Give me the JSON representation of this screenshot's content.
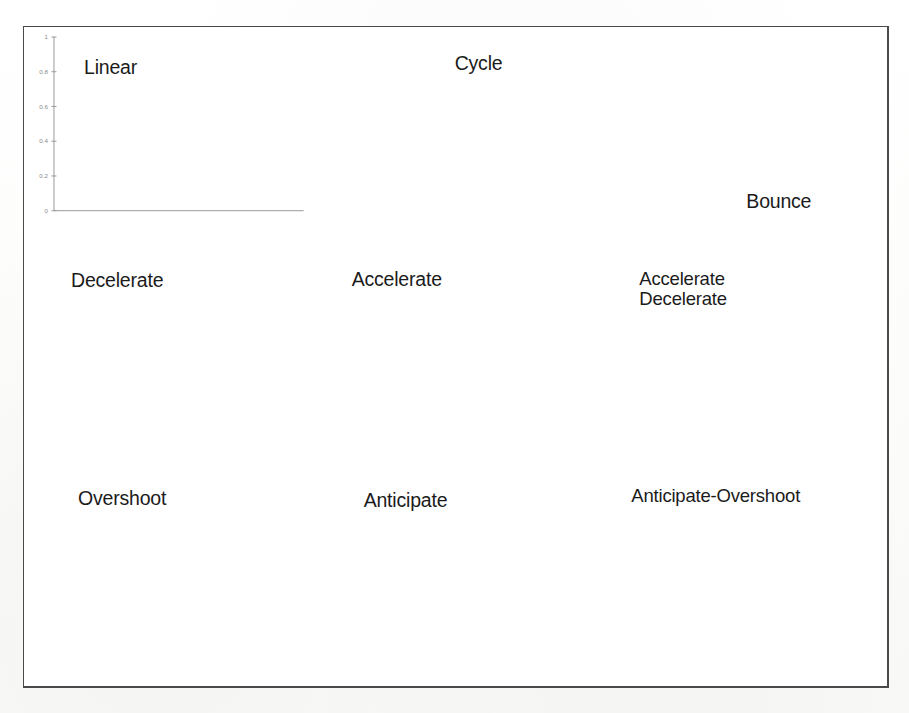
{
  "page": {
    "background_color": "#fdfdfc",
    "frame_color": "#4a4a4a",
    "curve_color": "#5d5d5d",
    "axis_color": "#9a9a9a",
    "label_color": "#8a8a8a",
    "title_color": "#1b1b1b"
  },
  "common": {
    "xlabel": "time",
    "x_ticks": [
      "0",
      "0.2",
      "0.4",
      "0.6",
      "0.8",
      "1"
    ],
    "x_tick_values": [
      0,
      0.2,
      0.4,
      0.6,
      0.8,
      1
    ],
    "xlim": [
      0,
      1
    ]
  },
  "chart_data": [
    {
      "id": "linear",
      "type": "line",
      "title": "Linear",
      "xlabel": "time",
      "ylabel": "",
      "xlim": [
        0,
        1
      ],
      "ylim": [
        0,
        1
      ],
      "grid": false,
      "legend": "none",
      "x_ticks": [
        "0",
        "0.2",
        "0.4",
        "0.6",
        "0.8",
        "1"
      ],
      "y_ticks": [
        "0",
        "0.2",
        "0.4",
        "0.6",
        "0.8",
        "1"
      ],
      "y_tick_values": [
        0,
        0.2,
        0.4,
        0.6,
        0.8,
        1
      ],
      "x": [
        0,
        0.05,
        0.1,
        0.15,
        0.2,
        0.25,
        0.3,
        0.35,
        0.4,
        0.45,
        0.5,
        0.55,
        0.6,
        0.65,
        0.7,
        0.75,
        0.8,
        0.85,
        0.9,
        0.95,
        1
      ],
      "values": [
        0,
        0.05,
        0.1,
        0.15,
        0.2,
        0.25,
        0.3,
        0.35,
        0.4,
        0.45,
        0.5,
        0.55,
        0.6,
        0.65,
        0.7,
        0.75,
        0.8,
        0.85,
        0.9,
        0.95,
        1
      ]
    },
    {
      "id": "cycle",
      "type": "line",
      "title": "Cycle",
      "xlabel": "time",
      "ylabel": "",
      "xlim": [
        0,
        1
      ],
      "ylim": [
        -1,
        1
      ],
      "grid": false,
      "legend": "none",
      "x_ticks": [
        "0",
        "0.2",
        "0.4",
        "0.6",
        "0.8",
        "1"
      ],
      "y_ticks": [
        "-1",
        "-0.5",
        "0",
        "0.5",
        "1"
      ],
      "y_tick_values": [
        -1,
        -0.5,
        0,
        0.5,
        1
      ],
      "x": [
        0,
        0.05,
        0.1,
        0.15,
        0.2,
        0.25,
        0.3,
        0.35,
        0.4,
        0.45,
        0.5,
        0.55,
        0.6,
        0.65,
        0.7,
        0.75,
        0.8,
        0.85,
        0.9,
        0.95,
        1
      ],
      "values": [
        0,
        0.309,
        0.588,
        0.809,
        0.951,
        1.0,
        0.951,
        0.809,
        0.588,
        0.309,
        0,
        -0.309,
        -0.588,
        -0.809,
        -0.951,
        -1.0,
        -0.951,
        -0.809,
        -0.588,
        -0.309,
        0
      ]
    },
    {
      "id": "bounce",
      "type": "line",
      "title": "Bounce",
      "xlabel": "time",
      "ylabel": "",
      "xlim": [
        0,
        1
      ],
      "ylim": [
        0,
        1
      ],
      "grid": false,
      "legend": "none",
      "x_ticks": [
        "0",
        "0.2",
        "0.4",
        "0.6",
        "0.8",
        "1"
      ],
      "y_ticks": [
        "0",
        "0.2",
        "0.4",
        "0.6",
        "0.8",
        "1"
      ],
      "y_tick_values": [
        0,
        0.2,
        0.4,
        0.6,
        0.8,
        1
      ],
      "x": [
        0,
        0.05,
        0.1,
        0.15,
        0.2,
        0.25,
        0.3,
        0.33,
        0.36,
        0.4,
        0.44,
        0.48,
        0.52,
        0.56,
        0.6,
        0.64,
        0.66,
        0.68,
        0.72,
        0.76,
        0.8,
        0.84,
        0.86,
        0.88,
        0.92,
        0.96,
        1
      ],
      "values": [
        0,
        0.018,
        0.073,
        0.165,
        0.294,
        0.459,
        0.99,
        1.0,
        0.94,
        0.82,
        0.735,
        0.705,
        0.73,
        0.81,
        0.9,
        0.98,
        1.0,
        0.985,
        0.945,
        0.925,
        0.935,
        0.975,
        0.995,
        0.99,
        0.96,
        0.965,
        1.0
      ]
    },
    {
      "id": "decelerate",
      "type": "line",
      "title": "Decelerate",
      "xlabel": "time",
      "ylabel": "",
      "xlim": [
        0,
        1
      ],
      "ylim": [
        0,
        1
      ],
      "grid": false,
      "legend": "none",
      "x_ticks": [
        "0",
        "0.2",
        "0.4",
        "0.6",
        "0.8",
        "1"
      ],
      "y_ticks": [
        "0",
        "0.2",
        "0.4",
        "0.6",
        "0.8",
        "1"
      ],
      "y_tick_values": [
        0,
        0.2,
        0.4,
        0.6,
        0.8,
        1
      ],
      "x": [
        0,
        0.05,
        0.1,
        0.15,
        0.2,
        0.25,
        0.3,
        0.35,
        0.4,
        0.45,
        0.5,
        0.55,
        0.6,
        0.65,
        0.7,
        0.75,
        0.8,
        0.85,
        0.9,
        0.95,
        1
      ],
      "values": [
        0,
        0.0975,
        0.19,
        0.2775,
        0.36,
        0.4375,
        0.51,
        0.5775,
        0.64,
        0.6975,
        0.75,
        0.7975,
        0.84,
        0.8775,
        0.91,
        0.9375,
        0.96,
        0.9775,
        0.99,
        0.9975,
        1
      ]
    },
    {
      "id": "accelerate",
      "type": "line",
      "title": "Accelerate",
      "xlabel": "time",
      "ylabel": "",
      "xlim": [
        0,
        1
      ],
      "ylim": [
        0,
        1
      ],
      "grid": false,
      "legend": "none",
      "x_ticks": [
        "0",
        "0.2",
        "0.4",
        "0.6",
        "0.8",
        "1"
      ],
      "y_ticks": [
        "0",
        "0.2",
        "0.4",
        "0.6",
        "0.8",
        "1"
      ],
      "y_tick_values": [
        0,
        0.2,
        0.4,
        0.6,
        0.8,
        1
      ],
      "x": [
        0,
        0.05,
        0.1,
        0.15,
        0.2,
        0.25,
        0.3,
        0.35,
        0.4,
        0.45,
        0.5,
        0.55,
        0.6,
        0.65,
        0.7,
        0.75,
        0.8,
        0.85,
        0.9,
        0.95,
        1
      ],
      "values": [
        0,
        0.0025,
        0.01,
        0.0225,
        0.04,
        0.0625,
        0.09,
        0.1225,
        0.16,
        0.2025,
        0.25,
        0.3025,
        0.36,
        0.4225,
        0.49,
        0.5625,
        0.64,
        0.7225,
        0.81,
        0.9025,
        1
      ]
    },
    {
      "id": "accelerate-decelerate",
      "type": "line",
      "title": "Accelerate\nDecelerate",
      "xlabel": "time",
      "ylabel": "",
      "xlim": [
        0,
        1
      ],
      "ylim": [
        0,
        1
      ],
      "grid": false,
      "legend": "none",
      "x_ticks": [
        "0",
        "0.2",
        "0.4",
        "0.6",
        "0.8",
        "1"
      ],
      "y_ticks": [
        "0",
        "0.2",
        "0.4",
        "0.6",
        "0.8",
        "1"
      ],
      "y_tick_values": [
        0,
        0.2,
        0.4,
        0.6,
        0.8,
        1
      ],
      "x": [
        0,
        0.05,
        0.1,
        0.15,
        0.2,
        0.25,
        0.3,
        0.35,
        0.4,
        0.45,
        0.5,
        0.55,
        0.6,
        0.65,
        0.7,
        0.75,
        0.8,
        0.85,
        0.9,
        0.95,
        1
      ],
      "values": [
        0,
        0.0062,
        0.0245,
        0.0545,
        0.0955,
        0.1464,
        0.2061,
        0.273,
        0.3455,
        0.4218,
        0.5,
        0.5782,
        0.6545,
        0.727,
        0.7939,
        0.8536,
        0.9045,
        0.9455,
        0.9755,
        0.9938,
        1
      ]
    },
    {
      "id": "overshoot",
      "type": "line",
      "title": "Overshoot",
      "xlabel": "time",
      "ylabel": "",
      "xlim": [
        0,
        1
      ],
      "ylim": [
        0,
        1.4
      ],
      "grid": false,
      "legend": "none",
      "x_ticks": [
        "0",
        "0.2",
        "0.4",
        "0.6",
        "0.8",
        "1"
      ],
      "y_ticks": [
        "0",
        "0.2",
        "0.4",
        "0.6",
        "0.8",
        "1",
        "1.2",
        "1.4"
      ],
      "y_tick_values": [
        0,
        0.2,
        0.4,
        0.6,
        0.8,
        1,
        1.2,
        1.4
      ],
      "x": [
        0,
        0.05,
        0.1,
        0.15,
        0.2,
        0.25,
        0.3,
        0.35,
        0.4,
        0.45,
        0.5,
        0.55,
        0.6,
        0.65,
        0.7,
        0.75,
        0.8,
        0.85,
        0.9,
        0.95,
        1
      ],
      "values": [
        0,
        0.205,
        0.385,
        0.545,
        0.68,
        0.795,
        0.89,
        0.965,
        1.03,
        1.075,
        1.11,
        1.135,
        1.145,
        1.14,
        1.125,
        1.105,
        1.08,
        1.055,
        1.03,
        1.015,
        1.02
      ]
    },
    {
      "id": "anticipate",
      "type": "line",
      "title": "Anticipate",
      "xlabel": "time",
      "ylabel": "",
      "xlim": [
        0,
        1
      ],
      "ylim": [
        -0.4,
        1
      ],
      "grid": false,
      "legend": "none",
      "x_ticks": [
        "0",
        "0.2",
        "0.4",
        "0.6",
        "0.8",
        "1"
      ],
      "y_ticks": [
        "-0.4",
        "-0.2",
        "0",
        "0.2",
        "0.4",
        "0.6",
        "0.8",
        "1"
      ],
      "y_tick_values": [
        -0.4,
        -0.2,
        0,
        0.2,
        0.4,
        0.6,
        0.8,
        1
      ],
      "x": [
        0,
        0.05,
        0.1,
        0.15,
        0.2,
        0.25,
        0.3,
        0.35,
        0.4,
        0.45,
        0.5,
        0.55,
        0.6,
        0.65,
        0.7,
        0.75,
        0.8,
        0.85,
        0.9,
        0.95,
        1
      ],
      "values": [
        0,
        -0.007,
        -0.024,
        -0.047,
        -0.073,
        -0.098,
        -0.119,
        -0.133,
        -0.142,
        -0.143,
        -0.131,
        -0.104,
        -0.058,
        0.01,
        0.103,
        0.228,
        0.387,
        0.587,
        0.831,
        1.124,
        1.0
      ]
    },
    {
      "id": "anticipate-overshoot",
      "type": "line",
      "title": "Anticipate-Overshoot",
      "xlabel": "time",
      "ylabel": "",
      "xlim": [
        0,
        1
      ],
      "ylim": [
        -0.5,
        1.5
      ],
      "grid": false,
      "legend": "none",
      "x_ticks": [
        "0",
        "0.2",
        "0.4",
        "0.6",
        "0.8",
        "1"
      ],
      "y_ticks": [
        "-0.5",
        "0",
        "0.5",
        "1",
        "1.5"
      ],
      "y_tick_values": [
        -0.5,
        0,
        0.5,
        1,
        1.5
      ],
      "x": [
        0,
        0.05,
        0.1,
        0.15,
        0.2,
        0.25,
        0.3,
        0.35,
        0.4,
        0.45,
        0.5,
        0.55,
        0.6,
        0.65,
        0.7,
        0.75,
        0.8,
        0.85,
        0.9,
        0.95,
        1
      ],
      "values": [
        0,
        -0.014,
        -0.035,
        -0.055,
        -0.063,
        -0.05,
        0.005,
        0.115,
        0.275,
        0.47,
        0.68,
        0.855,
        0.975,
        1.045,
        1.07,
        1.068,
        1.055,
        1.04,
        1.025,
        1.015,
        1.01
      ]
    }
  ]
}
